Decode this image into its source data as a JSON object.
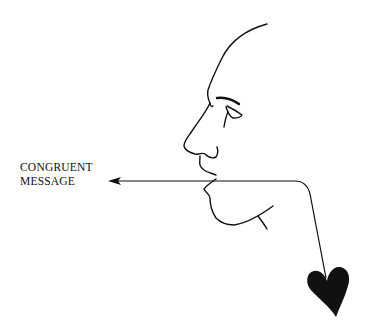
{
  "diagram": {
    "label_line1": "CONGRUENT",
    "label_line2": "MESSAGE",
    "elements": [
      "face-profile",
      "arrow-from-mouth",
      "line-to-heart",
      "heart"
    ],
    "colors": {
      "ink": "#111111",
      "background": "#ffffff"
    }
  }
}
